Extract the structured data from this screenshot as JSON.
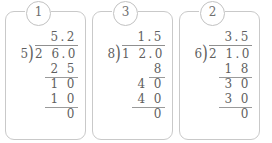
{
  "worksheet": {
    "title": "Long division practice problems",
    "problem_count": 3,
    "border_color": "#c9c9c9",
    "ink_color": "#5f5f5f",
    "problems": [
      {
        "badge": "1",
        "quotient": "5.2",
        "divisor": "5",
        "dividend": "2 6.0",
        "bracket": ")",
        "steps": [
          {
            "value": "2 5",
            "ruled": true
          },
          {
            "value": "1 0",
            "ruled": false
          },
          {
            "value": "1 0",
            "ruled": true
          },
          {
            "value": "0",
            "ruled": false
          }
        ],
        "expression": "26.0 ÷ 5 = 5.2"
      },
      {
        "badge": "3",
        "quotient": "1.5",
        "divisor": "8",
        "dividend": "1 2.0",
        "bracket": ")",
        "steps": [
          {
            "value": "8",
            "ruled": true
          },
          {
            "value": "4 0",
            "ruled": false
          },
          {
            "value": "4 0",
            "ruled": true
          },
          {
            "value": "0",
            "ruled": false
          }
        ],
        "expression": "12.0 ÷ 8 = 1.5"
      },
      {
        "badge": "2",
        "quotient": "3.5",
        "divisor": "6",
        "dividend": "2 1.0",
        "bracket": ")",
        "steps": [
          {
            "value": "1 8",
            "ruled": true
          },
          {
            "value": "3 0",
            "ruled": false
          },
          {
            "value": "3 0",
            "ruled": true
          },
          {
            "value": "0",
            "ruled": false
          }
        ],
        "expression": "21.0 ÷ 6 = 3.5"
      }
    ]
  }
}
